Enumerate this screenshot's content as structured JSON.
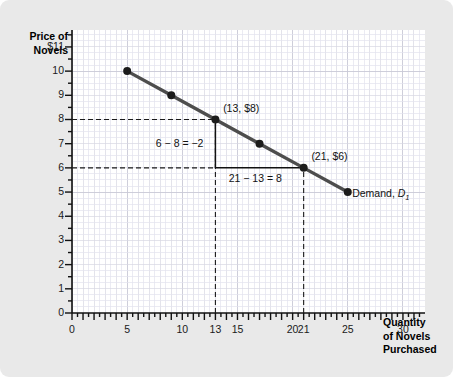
{
  "chart_data": {
    "type": "line",
    "title": "",
    "xlabel": "Quantity of Novels Purchased",
    "ylabel": "Price of Novels",
    "xlim": [
      0,
      32
    ],
    "ylim": [
      0,
      11.7
    ],
    "grid": true,
    "legend_position": "inline-right",
    "series": [
      {
        "name": "Demand, D1",
        "x": [
          5,
          9,
          13,
          17,
          21,
          25
        ],
        "y": [
          10,
          9,
          8,
          7,
          6,
          5
        ],
        "color": "#4d4d4d",
        "marker": "filled-circle"
      }
    ],
    "x_tick_labels": [
      "0",
      "5",
      "10",
      "13",
      "15",
      "20",
      "21",
      "25",
      "30"
    ],
    "x_tick_values": [
      0,
      5,
      10,
      13,
      15,
      20,
      21,
      25,
      30
    ],
    "y_tick_labels": [
      "0",
      "1",
      "2",
      "3",
      "4",
      "5",
      "6",
      "7",
      "8",
      "9",
      "10",
      "$11"
    ],
    "y_tick_values": [
      0,
      1,
      2,
      3,
      4,
      5,
      6,
      7,
      8,
      9,
      10,
      11
    ],
    "annotations": [
      {
        "text": "(13, $8)",
        "x": 13.7,
        "y": 8.45
      },
      {
        "text": "(21, $6)",
        "x": 21.7,
        "y": 6.45
      },
      {
        "text": "6 − 8 = −2",
        "x": 7.6,
        "y": 7.0
      },
      {
        "text": "21 − 13 = 8",
        "x": 14.2,
        "y": 5.55
      },
      {
        "text": "Demand, D1",
        "x": 25.6,
        "y": 5.0
      }
    ],
    "guide_lines": [
      {
        "type": "dashed-horizontal",
        "y": 8,
        "from_x": 0,
        "to_x": 13
      },
      {
        "type": "dashed-horizontal",
        "y": 6,
        "from_x": 0,
        "to_x": 13
      },
      {
        "type": "dashed-vertical",
        "x": 13,
        "from_y": 0,
        "to_y": 8
      },
      {
        "type": "dashed-vertical",
        "x": 21,
        "from_y": 0,
        "to_y": 6
      },
      {
        "type": "solid-vertical",
        "x": 13,
        "from_y": 6,
        "to_y": 8
      },
      {
        "type": "solid-horizontal",
        "y": 6,
        "from_x": 13,
        "to_x": 21
      }
    ]
  },
  "axis_titles": {
    "y_line1": "Price of",
    "y_line2": "Novels",
    "x_line1": "Quantity",
    "x_line2": "of Novels",
    "x_line3": "Purchased"
  },
  "labels": {
    "point_a": "(13, $8)",
    "point_b": "(21, $6)",
    "rise": "6 − 8 = −2",
    "run": "21 − 13 = 8",
    "demand_prefix": "Demand, ",
    "demand_symbol": "D",
    "demand_subscript": "1"
  },
  "colors": {
    "background": "#e9e9e9",
    "plot_background": "#ffffff",
    "line": "#4d4d4d",
    "axis": "#111111",
    "grid_major": "#c9c9d6",
    "grid_minor": "#e3e3ee",
    "text": "#111111"
  }
}
